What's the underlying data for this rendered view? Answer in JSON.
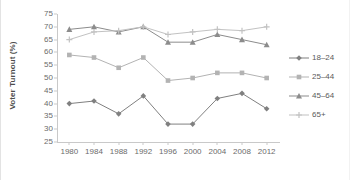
{
  "chart_data": {
    "type": "line",
    "title": "",
    "xlabel": "",
    "ylabel": "Voter Turnout (%)",
    "x": [
      1980,
      1984,
      1988,
      1992,
      1996,
      2000,
      2004,
      2008,
      2012
    ],
    "categories": [
      "1980",
      "1984",
      "1988",
      "1992",
      "1996",
      "2000",
      "2004",
      "2008",
      "2012"
    ],
    "ylim": [
      25,
      75
    ],
    "yticks": [
      25,
      30,
      35,
      40,
      45,
      50,
      55,
      60,
      65,
      70,
      75
    ],
    "ytick_labels": [
      "25",
      "30",
      "35",
      "40",
      "45",
      "50",
      "55",
      "60",
      "65",
      "70",
      "75"
    ],
    "grid": false,
    "legend_position": "right",
    "series": [
      {
        "name": "18–24",
        "marker": "diamond",
        "color": "#808080",
        "values": [
          40,
          41,
          36,
          43,
          32,
          32,
          42,
          44,
          38
        ]
      },
      {
        "name": "25–44",
        "marker": "square",
        "color": "#b3b3b3",
        "values": [
          59,
          58,
          54,
          58,
          49,
          50,
          52,
          52,
          50
        ]
      },
      {
        "name": "45–64",
        "marker": "triangle",
        "color": "#8c8c8c",
        "values": [
          69,
          70,
          68,
          70,
          64,
          64,
          67,
          65,
          63
        ]
      },
      {
        "name": "65+",
        "marker": "cross",
        "color": "#c2c2c2",
        "values": [
          65,
          68,
          68.5,
          70,
          67,
          68,
          69,
          68.5,
          70
        ]
      }
    ]
  },
  "legend": {
    "items": [
      {
        "label": "18–24"
      },
      {
        "label": "25–44"
      },
      {
        "label": "45–64"
      },
      {
        "label": "65+"
      }
    ]
  },
  "colors": {
    "axis": "#c9c9c9",
    "tick_text": "#6b6b6b",
    "title_text": "#4d4d4d",
    "background": "#ffffff"
  }
}
